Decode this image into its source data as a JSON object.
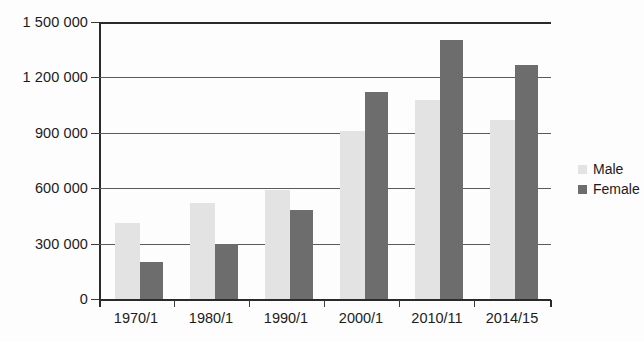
{
  "chart_data": {
    "type": "bar",
    "title": "",
    "subtitle": "",
    "xlabel": "",
    "ylabel": "",
    "categories": [
      "1970/1",
      "1980/1",
      "1990/1",
      "2000/1",
      "2010/11",
      "2014/15"
    ],
    "series": [
      {
        "name": "Male",
        "color": "#e3e3e3",
        "values": [
          410000,
          520000,
          590000,
          910000,
          1080000,
          970000
        ]
      },
      {
        "name": "Female",
        "color": "#6d6d6d",
        "values": [
          200000,
          298000,
          480000,
          1120000,
          1400000,
          1265000
        ]
      }
    ],
    "ylim": [
      0,
      1500000
    ],
    "y_ticks": [
      0,
      300000,
      600000,
      900000,
      1200000,
      1500000
    ],
    "y_tick_labels": [
      "0",
      "300 000",
      "600 000",
      "900 000",
      "1 200 000",
      "1 500 000"
    ],
    "grid": true,
    "legend_position": "right"
  },
  "legend": {
    "entries": [
      {
        "label": "Male",
        "swatch": "male-swatch"
      },
      {
        "label": "Female",
        "swatch": "female-swatch"
      }
    ]
  },
  "axis": {
    "y_labels": [
      "1 500 000",
      "1 200 000",
      "900 000",
      "600 000",
      "300 000",
      "0"
    ],
    "x_labels": [
      "1970/1",
      "1980/1",
      "1990/1",
      "2000/1",
      "2010/11",
      "2014/15"
    ]
  },
  "colors": {
    "male_bar": "#e3e3e3",
    "female_bar": "#6d6d6d",
    "axis": "#2a2a2a",
    "grid": "#5a5a5a",
    "background": "#fdfdfd",
    "text": "#1b1b1b"
  }
}
